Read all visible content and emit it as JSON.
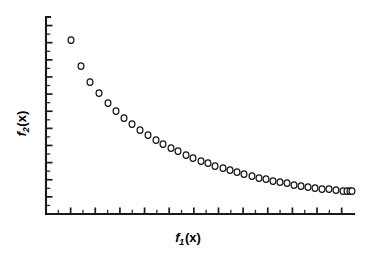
{
  "figure": {
    "background_color": "#ffffff",
    "axis_color": "#1a1a1a",
    "marker_stroke_color": "#111111",
    "marker_fill_color": "#ffffff",
    "xlabel_text": "f",
    "xlabel_sub": "1",
    "xlabel_arg": "(x)",
    "ylabel_text": "f",
    "ylabel_sub": "2",
    "ylabel_arg": "(x)"
  },
  "chart_data": {
    "type": "scatter",
    "title": "",
    "subtitle": "",
    "xlabel": "f1(x)",
    "ylabel": "f2(x)",
    "legend": [],
    "legend_position": "none",
    "grid": false,
    "xlim": [
      0,
      1
    ],
    "ylim": [
      0,
      1
    ],
    "xticklabels": [],
    "yticklabels": [],
    "x_major_ticks": 12,
    "x_minor_ticks": 12,
    "y_major_ticks": 11,
    "y_minor_ticks": 11,
    "marker": "open-circle",
    "marker_size": 6,
    "n_points": 40,
    "x": [
      0.082,
      0.115,
      0.144,
      0.173,
      0.202,
      0.231,
      0.259,
      0.288,
      0.317,
      0.346,
      0.375,
      0.404,
      0.433,
      0.462,
      0.49,
      0.519,
      0.548,
      0.577,
      0.606,
      0.635,
      0.663,
      0.692,
      0.721,
      0.75,
      0.779,
      0.808,
      0.836,
      0.865,
      0.894,
      0.923,
      0.952,
      0.981,
      1.01,
      1.038,
      1.067,
      1.096,
      1.125,
      1.154,
      1.183,
      1.212
    ],
    "y": [
      0.884,
      0.752,
      0.671,
      0.615,
      0.564,
      0.523,
      0.488,
      0.457,
      0.429,
      0.404,
      0.381,
      0.361,
      0.342,
      0.325,
      0.309,
      0.295,
      0.281,
      0.269,
      0.257,
      0.246,
      0.236,
      0.227,
      0.218,
      0.21,
      0.202,
      0.195,
      0.188,
      0.182,
      0.176,
      0.17,
      0.165,
      0.16,
      0.155,
      0.151,
      0.147,
      0.143,
      0.139,
      0.136,
      0.133,
      0.13
    ],
    "points_px": [
      [
        71,
        40
      ],
      [
        81,
        66
      ],
      [
        90,
        82
      ],
      [
        99,
        93
      ],
      [
        108,
        103
      ],
      [
        116,
        111
      ],
      [
        124,
        118
      ],
      [
        132,
        124
      ],
      [
        140,
        130
      ],
      [
        148,
        135
      ],
      [
        156,
        140
      ],
      [
        163,
        144
      ],
      [
        171,
        148
      ],
      [
        178,
        151
      ],
      [
        186,
        155
      ],
      [
        193,
        158
      ],
      [
        201,
        161
      ],
      [
        208,
        163
      ],
      [
        215,
        166
      ],
      [
        223,
        168
      ],
      [
        230,
        170
      ],
      [
        237,
        172
      ],
      [
        244,
        174
      ],
      [
        252,
        176
      ],
      [
        259,
        178
      ],
      [
        266,
        179
      ],
      [
        273,
        181
      ],
      [
        280,
        182
      ],
      [
        287,
        183
      ],
      [
        294,
        185
      ],
      [
        301,
        186
      ],
      [
        308,
        187
      ],
      [
        315,
        188
      ],
      [
        322,
        189
      ],
      [
        329,
        189
      ],
      [
        336,
        190
      ],
      [
        343,
        191
      ],
      [
        347,
        191
      ],
      [
        350,
        191
      ],
      [
        352,
        191
      ]
    ]
  },
  "geometry": {
    "origin_x": 46,
    "origin_y": 214,
    "x_axis_end": 354,
    "y_axis_top": 17
  }
}
